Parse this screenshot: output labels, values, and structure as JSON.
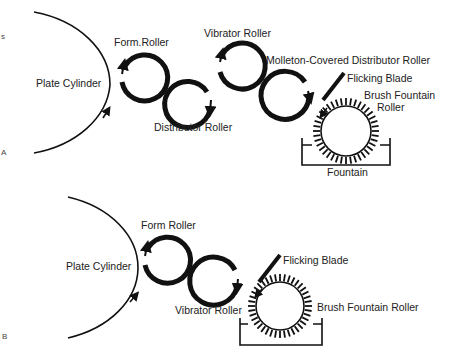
{
  "diagram_a": {
    "panel_label": "A",
    "edge_mark": "s",
    "labels": {
      "plate_cylinder": "Plate Cylinder",
      "form_roller": "Form.Roller",
      "distributor_roller": "Distributor Roller",
      "vibrator_roller": "Vibrator Roller",
      "molleton_roller": "Molleton-Covered Distributor Roller",
      "flicking_blade": "Flicking Blade",
      "brush_fountain_line1": "Brush Fountain",
      "brush_fountain_line2": "Roller",
      "fountain": "Fountain"
    }
  },
  "diagram_b": {
    "panel_label": "B",
    "labels": {
      "plate_cylinder": "Plate Cylinder",
      "form_roller": "Form Roller",
      "vibrator_roller": "Vibrator Roller",
      "flicking_blade": "Flicking Blade",
      "brush_fountain": "Brush Fountain Roller"
    }
  },
  "colors": {
    "ink": "#111111",
    "background": "#ffffff"
  }
}
